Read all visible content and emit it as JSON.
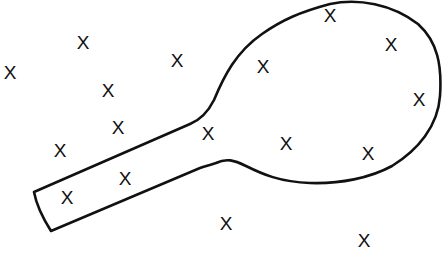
{
  "diagram": {
    "shape": {
      "name": "racket-outline",
      "stroke_color": "#111111",
      "fill": "none"
    },
    "marks": [
      {
        "label": "X",
        "x": 10,
        "y": 72
      },
      {
        "label": "X",
        "x": 83,
        "y": 42
      },
      {
        "label": "X",
        "x": 108,
        "y": 90
      },
      {
        "label": "X",
        "x": 177,
        "y": 60
      },
      {
        "label": "X",
        "x": 118,
        "y": 127
      },
      {
        "label": "X",
        "x": 60,
        "y": 150
      },
      {
        "label": "X",
        "x": 125,
        "y": 178
      },
      {
        "label": "X",
        "x": 67,
        "y": 197
      },
      {
        "label": "X",
        "x": 208,
        "y": 133
      },
      {
        "label": "X",
        "x": 263,
        "y": 66
      },
      {
        "label": "X",
        "x": 330,
        "y": 15
      },
      {
        "label": "X",
        "x": 391,
        "y": 44
      },
      {
        "label": "X",
        "x": 419,
        "y": 99
      },
      {
        "label": "X",
        "x": 286,
        "y": 143
      },
      {
        "label": "X",
        "x": 368,
        "y": 153
      },
      {
        "label": "X",
        "x": 226,
        "y": 223
      },
      {
        "label": "X",
        "x": 364,
        "y": 240
      }
    ]
  }
}
